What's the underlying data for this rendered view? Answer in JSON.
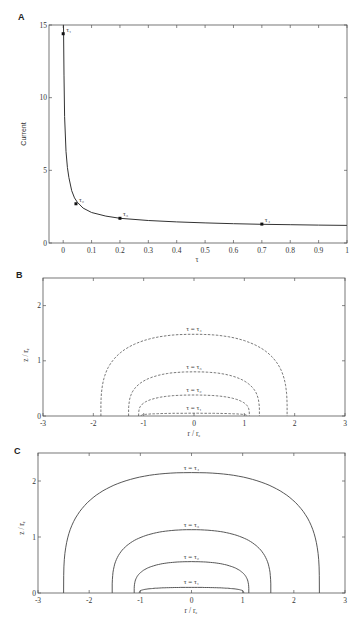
{
  "chart_data": [
    {
      "panel": "A",
      "type": "line",
      "title": "",
      "xlabel": "τ",
      "ylabel": "Current",
      "xlim": [
        -0.05,
        1
      ],
      "ylim": [
        0,
        15
      ],
      "xticks": [
        0,
        0.1,
        0.2,
        0.3,
        0.4,
        0.5,
        0.6,
        0.7,
        0.8,
        0.9,
        1
      ],
      "xtick_labels": [
        "0",
        "0.1",
        "0.2",
        "0.3",
        "0.4",
        "0.5",
        "0.6",
        "0.7",
        "0.8",
        "0.9",
        "1"
      ],
      "yticks": [
        0,
        5,
        10,
        15
      ],
      "ytick_labels": [
        "0",
        "5",
        "10",
        "15"
      ],
      "grid": false,
      "series": [
        {
          "name": "Current vs τ",
          "x": [
            0.001,
            0.003,
            0.005,
            0.01,
            0.015,
            0.02,
            0.03,
            0.04,
            0.05,
            0.07,
            0.1,
            0.15,
            0.2,
            0.3,
            0.4,
            0.5,
            0.6,
            0.7,
            0.8,
            0.9,
            1.0
          ],
          "y": [
            15,
            11.5,
            8.7,
            6.3,
            5.2,
            4.5,
            3.6,
            3.1,
            2.8,
            2.4,
            2.1,
            1.85,
            1.7,
            1.55,
            1.45,
            1.38,
            1.33,
            1.29,
            1.26,
            1.23,
            1.21
          ]
        }
      ],
      "annotations": [
        {
          "label": "τ₁",
          "x": 0.0,
          "y": 14.4
        },
        {
          "label": "τ₂",
          "x": 0.045,
          "y": 2.7
        },
        {
          "label": "τ₃",
          "x": 0.2,
          "y": 1.7
        },
        {
          "label": "τ₄",
          "x": 0.7,
          "y": 1.3
        }
      ]
    },
    {
      "panel": "B",
      "type": "line",
      "title": "",
      "xlabel": "r / rₑ",
      "ylabel": "z / rₑ",
      "xlim": [
        -3,
        3
      ],
      "ylim": [
        0,
        2.5
      ],
      "xticks": [
        -3,
        -2,
        -1,
        0,
        1,
        2,
        3
      ],
      "xtick_labels": [
        "-3",
        "-2",
        "-1",
        "0",
        "1",
        "2",
        "3"
      ],
      "yticks": [
        0,
        1,
        2
      ],
      "ytick_labels": [
        "0",
        "1",
        "2"
      ],
      "line_style": "dashed",
      "series": [
        {
          "name": "τ = τ₁",
          "half_width": 1.05,
          "height": 0.05
        },
        {
          "name": "τ = τ₂",
          "half_width": 1.1,
          "height": 0.38
        },
        {
          "name": "τ = τ₃",
          "half_width": 1.3,
          "height": 0.8
        },
        {
          "name": "τ = τ₄",
          "half_width": 1.85,
          "height": 1.48
        }
      ]
    },
    {
      "panel": "C",
      "type": "line",
      "title": "",
      "xlabel": "r / rₑ",
      "ylabel": "z / rₑ",
      "xlim": [
        -3,
        3
      ],
      "ylim": [
        0,
        2.5
      ],
      "xticks": [
        -3,
        -2,
        -1,
        0,
        1,
        2,
        3
      ],
      "xtick_labels": [
        "-3",
        "-2",
        "-1",
        "0",
        "1",
        "2",
        "3"
      ],
      "yticks": [
        0,
        1,
        2
      ],
      "ytick_labels": [
        "0",
        "1",
        "2"
      ],
      "line_style": "solid",
      "series": [
        {
          "name": "τ = τ₁",
          "half_width": 1.02,
          "height": 0.1
        },
        {
          "name": "τ = τ₂",
          "half_width": 1.12,
          "height": 0.56
        },
        {
          "name": "τ = τ₃",
          "half_width": 1.55,
          "height": 1.13
        },
        {
          "name": "τ = τ₄",
          "half_width": 2.5,
          "height": 2.15
        }
      ]
    }
  ],
  "panels": {
    "A": {
      "letter": "A"
    },
    "B": {
      "letter": "B"
    },
    "C": {
      "letter": "C"
    }
  }
}
